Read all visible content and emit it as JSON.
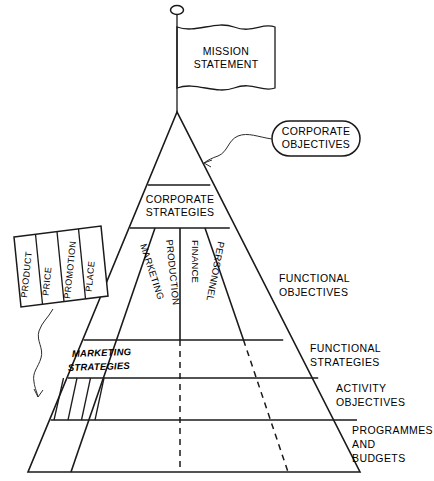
{
  "diagram": {
    "title_flag": {
      "line1": "MISSION",
      "line2": "STATEMENT"
    },
    "callout": {
      "line1": "CORPORATE",
      "line2": "OBJECTIVES"
    },
    "bands": {
      "corporate_strategies": {
        "line1": "CORPORATE",
        "line2": "STRATEGIES"
      },
      "marketing_strategies": {
        "line1": "MARKETING",
        "line2": "STRATEGIES"
      }
    },
    "columns": [
      {
        "label": "MARKETING"
      },
      {
        "label": "PRODUCTION"
      },
      {
        "label": "FINANCE"
      },
      {
        "label": "PERSONNEL"
      }
    ],
    "marketing_mix": [
      {
        "label": "PRODUCT"
      },
      {
        "label": "PRICE"
      },
      {
        "label": "PROMOTION"
      },
      {
        "label": "PLACE"
      }
    ],
    "side_labels": [
      {
        "line1": "FUNCTIONAL",
        "line2": "OBJECTIVES",
        "line3": ""
      },
      {
        "line1": "FUNCTIONAL",
        "line2": "STRATEGIES",
        "line3": ""
      },
      {
        "line1": "ACTIVITY",
        "line2": "OBJECTIVES",
        "line3": ""
      },
      {
        "line1": "PROGRAMMES",
        "line2": "AND",
        "line3": "BUDGETS"
      }
    ],
    "colors": {
      "ink": "#1a1a1a",
      "background": "#ffffff"
    }
  }
}
